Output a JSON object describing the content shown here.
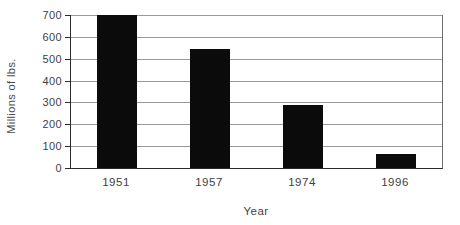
{
  "chart_data": {
    "type": "bar",
    "title": "",
    "xlabel": "Year",
    "ylabel": "Millions of lbs.",
    "categories": [
      "1951",
      "1957",
      "1974",
      "1996"
    ],
    "values": [
      700,
      545,
      290,
      65
    ],
    "ylim": [
      0,
      700
    ],
    "yticks": [
      0,
      100,
      200,
      300,
      400,
      500,
      600,
      700
    ],
    "grid": true,
    "legend": "none",
    "colors": {
      "bar": "#0b0b0b",
      "gridline": "#9a9a9a",
      "axis": "#2b2b2b",
      "text": "#3f3f3f",
      "background": "#ffffff"
    }
  }
}
